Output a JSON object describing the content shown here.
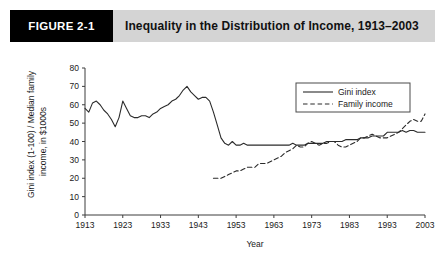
{
  "figure": {
    "number_label": "FIGURE 2-1",
    "title": "Inequality in the Distribution of Income, 1913–2003"
  },
  "colors": {
    "header_band": "#d4d4d4",
    "number_box": "#000000",
    "number_text": "#ffffff",
    "line": "#2b2b2b",
    "axis": "#3d3d3d",
    "plot_background": "#ffffff"
  },
  "chart_data": {
    "type": "line",
    "title": "Inequality in the Distribution of Income, 1913–2003",
    "xlabel": "Year",
    "ylabel": "Gini index (1-100) / Median family income, in $1000s",
    "xlim": [
      1913,
      2003
    ],
    "ylim": [
      0,
      80
    ],
    "xticks": [
      1913,
      1923,
      1933,
      1943,
      1953,
      1963,
      1973,
      1983,
      1993,
      2003
    ],
    "yticks": [
      0,
      10,
      20,
      30,
      40,
      50,
      60,
      70,
      80
    ],
    "grid": false,
    "legend_position": "top-right",
    "series": [
      {
        "name": "Gini index",
        "style": "solid",
        "x": [
          1913,
          1914,
          1915,
          1916,
          1917,
          1918,
          1919,
          1920,
          1921,
          1922,
          1923,
          1924,
          1925,
          1926,
          1927,
          1928,
          1929,
          1930,
          1931,
          1932,
          1933,
          1934,
          1935,
          1936,
          1937,
          1938,
          1939,
          1940,
          1941,
          1942,
          1943,
          1944,
          1945,
          1946,
          1947,
          1948,
          1949,
          1950,
          1951,
          1952,
          1953,
          1954,
          1955,
          1956,
          1957,
          1958,
          1959,
          1960,
          1961,
          1962,
          1963,
          1964,
          1965,
          1966,
          1967,
          1968,
          1969,
          1970,
          1971,
          1972,
          1973,
          1974,
          1975,
          1976,
          1977,
          1978,
          1979,
          1980,
          1981,
          1982,
          1983,
          1984,
          1985,
          1986,
          1987,
          1988,
          1989,
          1990,
          1991,
          1992,
          1993,
          1994,
          1995,
          1996,
          1997,
          1998,
          1999,
          2000,
          2001,
          2002,
          2003
        ],
        "y": [
          58,
          56,
          61,
          62,
          60,
          57,
          55,
          52,
          48,
          53,
          62,
          58,
          54,
          53,
          53,
          54,
          54,
          53,
          55,
          56,
          58,
          59,
          60,
          62,
          63,
          65,
          68,
          70,
          67,
          65,
          63,
          64,
          64,
          62,
          56,
          49,
          42,
          39,
          38,
          40,
          38,
          38,
          39,
          38,
          38,
          38,
          38,
          38,
          38,
          38,
          38,
          38,
          38,
          38,
          38,
          39,
          38,
          38,
          38,
          39,
          39,
          39,
          39,
          39,
          40,
          40,
          40,
          40,
          40,
          41,
          41,
          41,
          41,
          42,
          42,
          42,
          43,
          43,
          43,
          43,
          45,
          45,
          45,
          45,
          46,
          45,
          46,
          46,
          45,
          45,
          45
        ]
      },
      {
        "name": "Family income",
        "style": "dashed",
        "x": [
          1947,
          1948,
          1949,
          1950,
          1951,
          1952,
          1953,
          1954,
          1955,
          1956,
          1957,
          1958,
          1959,
          1960,
          1961,
          1962,
          1963,
          1964,
          1965,
          1966,
          1967,
          1968,
          1969,
          1970,
          1971,
          1972,
          1973,
          1974,
          1975,
          1976,
          1977,
          1978,
          1979,
          1980,
          1981,
          1982,
          1983,
          1984,
          1985,
          1986,
          1987,
          1988,
          1989,
          1990,
          1991,
          1992,
          1993,
          1994,
          1995,
          1996,
          1997,
          1998,
          1999,
          2000,
          2001,
          2002,
          2003
        ],
        "y": [
          20,
          20,
          20,
          21,
          22,
          23,
          24,
          24,
          25,
          26,
          26,
          26,
          28,
          28,
          28,
          29,
          30,
          31,
          32,
          34,
          35,
          36,
          38,
          37,
          37,
          39,
          40,
          39,
          38,
          39,
          39,
          40,
          40,
          38,
          37,
          37,
          38,
          39,
          40,
          42,
          42,
          43,
          44,
          43,
          42,
          42,
          42,
          43,
          44,
          45,
          47,
          49,
          51,
          52,
          51,
          51,
          55
        ]
      }
    ],
    "legend": [
      {
        "label": "Gini index",
        "style": "solid"
      },
      {
        "label": "Family income",
        "style": "dashed"
      }
    ]
  }
}
